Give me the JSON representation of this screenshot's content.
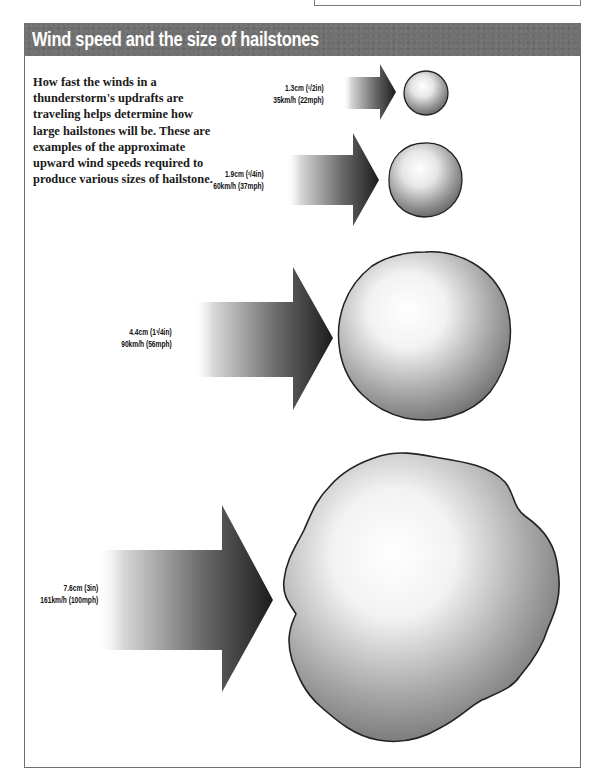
{
  "header": {
    "title": "Wind speed and the size of hailstones",
    "color": "#707070"
  },
  "intro": {
    "text": "How fast the winds in a thunderstorm's updrafts are traveling helps determine how large hailstones will be. These are examples of the approximate upward wind speeds required to produce various sizes of hailstone."
  },
  "examples": [
    {
      "size_metric": "1.3cm",
      "size_imperial": "(1/2in)",
      "speed_metric": "35km/h",
      "speed_imperial": "(22mph)",
      "size_line": "1.3cm (¹/2in)",
      "speed_line": "35km/h (22mph)"
    },
    {
      "size_metric": "1.9cm",
      "size_imperial": "(3/4in)",
      "speed_metric": "60km/h",
      "speed_imperial": "(37mph)",
      "size_line": "1.9cm (³/4in)",
      "speed_line": "60km/h (37mph)"
    },
    {
      "size_metric": "4.4cm",
      "size_imperial": "(1 3/4in)",
      "speed_metric": "90km/h",
      "speed_imperial": "(56mph)",
      "size_line": "4.4cm (1³/4in)",
      "speed_line": "90km/h (56mph)"
    },
    {
      "size_metric": "7.6cm",
      "size_imperial": "(3in)",
      "speed_metric": "161km/h",
      "speed_imperial": "(100mph)",
      "size_line": "7.6cm (3in)",
      "speed_line": "161km/h (100mph)"
    }
  ],
  "icons": {
    "arrow": "wind-arrow-icon",
    "hailstone": "hailstone-icon"
  }
}
